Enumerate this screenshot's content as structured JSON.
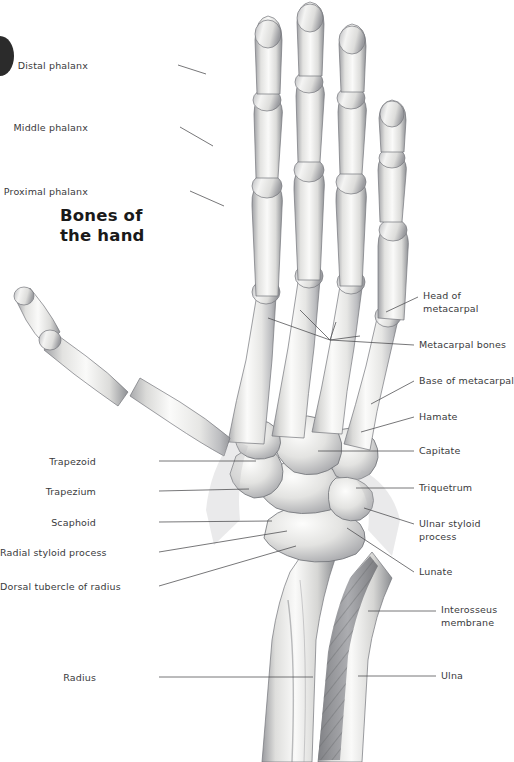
{
  "figure": {
    "title_line1": "Bones of",
    "title_line2": "the hand",
    "page_tab": "page-marker-tab",
    "background": "#ffffff",
    "label_color": "#3a3a3c",
    "leader_color": "#4a4a4c",
    "bone_light": "#fbfbfa",
    "bone_mid": "#d2d2d0",
    "bone_shadow": "#8f9094",
    "outline": "#6d6e72"
  },
  "labels_left": [
    {
      "text": "Distal phalanx",
      "x": 88,
      "y": 60,
      "lx": 178,
      "ly": 65,
      "tx": 206,
      "ty": 74
    },
    {
      "text": "Middle phalanx",
      "x": 88,
      "y": 122,
      "lx": 180,
      "ly": 127,
      "tx": 213,
      "ty": 146
    },
    {
      "text": "Proximal phalanx",
      "x": 88,
      "y": 186,
      "lx": 190,
      "ly": 191,
      "tx": 224,
      "ty": 206
    },
    {
      "text": "Trapezoid",
      "x": 96,
      "y": 456,
      "lx": 159,
      "ly": 461,
      "tx": 256,
      "ty": 461
    },
    {
      "text": "Trapezium",
      "x": 96,
      "y": 486,
      "lx": 159,
      "ly": 491,
      "tx": 249,
      "ty": 489
    },
    {
      "text": "Scaphoid",
      "x": 96,
      "y": 517,
      "lx": 159,
      "ly": 522,
      "tx": 272,
      "ty": 521
    },
    {
      "text": "Radial styloid process",
      "x": 96,
      "y": 547,
      "lx": 159,
      "ly": 552,
      "tx": 287,
      "ty": 531
    },
    {
      "text": "Dorsal tubercle of radius",
      "x": 96,
      "y": 581,
      "lx": 159,
      "ly": 586,
      "tx": 296,
      "ty": 546
    },
    {
      "text": "Radius",
      "x": 96,
      "y": 672,
      "lx": 159,
      "ly": 677,
      "tx": 313,
      "ty": 677
    }
  ],
  "labels_right": [
    {
      "text": "Head of",
      "x": 423,
      "y": 290,
      "line": false
    },
    {
      "text": "metacarpal",
      "x": 423,
      "y": 303,
      "lx": 418,
      "ly": 297,
      "tx": 386,
      "ty": 312
    },
    {
      "text": "Metacarpal bones",
      "x": 419,
      "y": 339,
      "lx": 414,
      "ly": 345,
      "tx": 330,
      "ty": 340
    },
    {
      "text": "Base of metacarpal",
      "x": 419,
      "y": 375,
      "lx": 414,
      "ly": 381,
      "tx": 371,
      "ty": 404
    },
    {
      "text": "Hamate",
      "x": 419,
      "y": 411,
      "lx": 414,
      "ly": 417,
      "tx": 361,
      "ty": 432
    },
    {
      "text": "Capitate",
      "x": 419,
      "y": 445,
      "lx": 414,
      "ly": 451,
      "tx": 318,
      "ty": 451
    },
    {
      "text": "Triquetrum",
      "x": 419,
      "y": 482,
      "lx": 414,
      "ly": 488,
      "tx": 356,
      "ty": 488
    },
    {
      "text": "Ulnar styloid",
      "x": 419,
      "y": 518,
      "lx": 414,
      "ly": 524,
      "tx": 364,
      "ty": 508
    },
    {
      "text": "process",
      "x": 419,
      "y": 531,
      "line": false
    },
    {
      "text": "Lunate",
      "x": 419,
      "y": 566,
      "lx": 414,
      "ly": 572,
      "tx": 347,
      "ty": 528
    },
    {
      "text": "Interosseus",
      "x": 441,
      "y": 604,
      "line": false
    },
    {
      "text": "membrane",
      "x": 441,
      "y": 617,
      "lx": 436,
      "ly": 611,
      "tx": 368,
      "ty": 611
    },
    {
      "text": "Ulna",
      "x": 441,
      "y": 670,
      "lx": 436,
      "ly": 676,
      "tx": 358,
      "ty": 676
    }
  ],
  "anatomy": {
    "regions": [
      "distal phalanges",
      "middle phalanges",
      "proximal phalanges",
      "metacarpals",
      "carpal bones",
      "radius",
      "ulna",
      "interosseus membrane"
    ],
    "view": "dorsal view of right hand skeleton"
  }
}
